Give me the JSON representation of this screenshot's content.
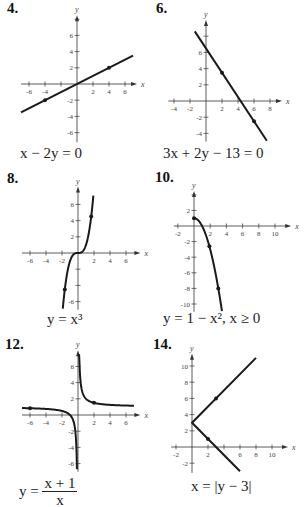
{
  "chart_data": [
    {
      "id": "p4",
      "label": "4.",
      "type": "line",
      "equation": "x − 2y = 0",
      "origin_px": [
        77,
        84
      ],
      "scale_px": [
        8,
        8.1
      ],
      "xlim": [
        -7,
        7
      ],
      "ylim": [
        -7.2,
        8
      ],
      "x_ticks": [
        -6,
        -4,
        -2,
        2,
        4,
        6
      ],
      "x_tick_labels": [
        "-6",
        "-4",
        "",
        "2",
        "4",
        "6"
      ],
      "y_ticks": [
        -6,
        -4,
        -2,
        2,
        4,
        6
      ],
      "y_tick_labels": [
        "-6",
        "-4",
        "-2",
        "2",
        "4",
        "6"
      ],
      "xlabel": "x",
      "ylabel": "y",
      "x_axis_range": [
        -7,
        7.5
      ],
      "y_axis_range": [
        -7.2,
        8.5
      ],
      "series": [
        {
          "name": "x - 2y = 0",
          "kind": "points",
          "x": [
            -7,
            7
          ],
          "y": [
            -3.5,
            3.5
          ]
        }
      ],
      "markers": [
        [
          -4,
          -2
        ],
        [
          4,
          2
        ]
      ],
      "grid": false
    },
    {
      "id": "p6",
      "label": "6.",
      "type": "line",
      "equation": "3x + 2y − 13 = 0",
      "origin_px": [
        206,
        101
      ],
      "scale_px": [
        8,
        8.1
      ],
      "xlim": [
        -4.5,
        9
      ],
      "ylim": [
        -5,
        9.5
      ],
      "x_ticks": [
        -4,
        -2,
        2,
        4,
        6,
        8
      ],
      "x_tick_labels": [
        "-4",
        "-2",
        "2",
        "4",
        "6",
        "8"
      ],
      "y_ticks": [
        -4,
        -2,
        2,
        4,
        6,
        8
      ],
      "y_tick_labels": [
        "-4",
        "-2",
        "2",
        "4",
        "6",
        ""
      ],
      "xlabel": "x",
      "ylabel": "y",
      "x_axis_range": [
        -4.7,
        9.5
      ],
      "y_axis_range": [
        -5,
        10
      ],
      "series": [
        {
          "name": "3x + 2y - 13 = 0",
          "kind": "points",
          "x": [
            -1.4,
            7.6
          ],
          "y": [
            8.6,
            -4.9
          ]
        }
      ],
      "markers": [
        [
          2,
          3.5
        ],
        [
          6,
          -2.5
        ]
      ],
      "grid": false
    },
    {
      "id": "p8",
      "label": "8.",
      "type": "line",
      "equation": "y = x³",
      "origin_px": [
        78,
        253
      ],
      "scale_px": [
        8,
        8.1
      ],
      "xlim": [
        -7,
        7
      ],
      "ylim": [
        -7,
        7.5
      ],
      "x_ticks": [
        -6,
        -4,
        -2,
        2,
        4,
        6
      ],
      "x_tick_labels": [
        "-6",
        "-4",
        "-2",
        "2",
        "4",
        "6"
      ],
      "y_ticks": [
        -6,
        -4,
        -2,
        2,
        4,
        6
      ],
      "y_tick_labels": [
        "-6",
        "",
        "",
        "2",
        "4",
        "6"
      ],
      "xlabel": "x",
      "ylabel": "y",
      "x_axis_range": [
        -7,
        7.8
      ],
      "y_axis_range": [
        -7,
        8.2
      ],
      "series": [
        {
          "name": "y = x^3",
          "kind": "function",
          "fn": "cube",
          "domain": [
            -1.9,
            1.92
          ]
        }
      ],
      "markers": [
        [
          -1.65,
          -4.5
        ],
        [
          1.65,
          4.5
        ]
      ],
      "grid": false
    },
    {
      "id": "p10",
      "label": "10.",
      "type": "line",
      "equation": "y = 1 − x²,  x ≥ 0",
      "origin_px": [
        194,
        226
      ],
      "scale_px": [
        8.1,
        7.8
      ],
      "xlim": [
        -2.5,
        11
      ],
      "ylim": [
        -11,
        3.5
      ],
      "x_ticks": [
        -2,
        2,
        4,
        6,
        8,
        10
      ],
      "x_tick_labels": [
        "-2",
        "2",
        "4",
        "6",
        "8",
        "10"
      ],
      "y_ticks": [
        -10,
        -8,
        -6,
        -4,
        -2,
        2
      ],
      "y_tick_labels": [
        "-10",
        "-8",
        "-6",
        "-4",
        "-2",
        "2"
      ],
      "xlabel": "x",
      "ylabel": "y",
      "x_axis_range": [
        -2.5,
        12
      ],
      "y_axis_range": [
        -11,
        4.5
      ],
      "series": [
        {
          "name": "y = 1 - x^2, x >= 0",
          "kind": "function",
          "fn": "one_minus_sq",
          "domain": [
            0,
            3.45
          ]
        }
      ],
      "markers": [
        [
          0,
          1
        ],
        [
          1.9,
          -2.6
        ],
        [
          3,
          -8
        ]
      ],
      "grid": false
    },
    {
      "id": "p12",
      "label": "12.",
      "type": "line",
      "equation_num": "x + 1",
      "equation_den": "x",
      "equation_lhs": "y =",
      "origin_px": [
        78,
        415
      ],
      "scale_px": [
        8,
        8.1
      ],
      "xlim": [
        -7,
        7
      ],
      "ylim": [
        -7,
        7.5
      ],
      "x_ticks": [
        -6,
        -4,
        -2,
        2,
        4,
        6
      ],
      "x_tick_labels": [
        "-6",
        "-4",
        "-2",
        "2",
        "4",
        "6"
      ],
      "y_ticks": [
        -6,
        -4,
        -2,
        2,
        4,
        6
      ],
      "y_tick_labels": [
        "-6",
        "-4",
        "-2",
        "2",
        "4",
        "6"
      ],
      "xlabel": "x",
      "ylabel": "y",
      "x_axis_range": [
        -7,
        7.8
      ],
      "y_axis_range": [
        -7,
        8
      ],
      "series": [
        {
          "name": "y = (x+1)/x, x<0",
          "kind": "function",
          "fn": "recip_plus_one",
          "domain": [
            -7,
            -0.13
          ]
        },
        {
          "name": "y = (x+1)/x, x>0",
          "kind": "function",
          "fn": "recip_plus_one",
          "domain": [
            0.135,
            7
          ]
        }
      ],
      "markers": [
        [
          -6,
          0.83
        ],
        [
          2,
          1.5
        ]
      ],
      "grid": false
    },
    {
      "id": "p14",
      "label": "14.",
      "type": "line",
      "equation": "x = |y − 3|",
      "origin_px": [
        192,
        447
      ],
      "scale_px": [
        8,
        8.1
      ],
      "xlim": [
        -2.5,
        11
      ],
      "ylim": [
        -3,
        11
      ],
      "x_ticks": [
        -2,
        2,
        4,
        6,
        8,
        10
      ],
      "x_tick_labels": [
        "-2",
        "2",
        "",
        "6",
        "8",
        "10"
      ],
      "y_ticks": [
        -2,
        2,
        4,
        6,
        8,
        10
      ],
      "y_tick_labels": [
        "-2",
        "2",
        "4",
        "6",
        "8",
        "10"
      ],
      "xlabel": "x",
      "ylabel": "y",
      "x_axis_range": [
        -2.6,
        12
      ],
      "y_axis_range": [
        -3.2,
        11.5
      ],
      "series": [
        {
          "name": "x = |y - 3|",
          "kind": "points",
          "x": [
            6,
            0,
            8
          ],
          "y": [
            -3,
            3,
            11
          ]
        }
      ],
      "markers": [
        [
          2,
          1
        ],
        [
          3,
          6
        ]
      ],
      "grid": false
    }
  ],
  "panels": [
    {
      "label": "4.",
      "equation": "x − 2y = 0"
    },
    {
      "label": "6.",
      "equation": "3x + 2y − 13 = 0"
    },
    {
      "label": "8.",
      "equation": "y = x³"
    },
    {
      "label": "10.",
      "equation": "y = 1 − x²,  x ≥ 0"
    },
    {
      "label": "12.",
      "equation_lhs": "y =",
      "equation_num": "x + 1",
      "equation_den": "x"
    },
    {
      "label": "14.",
      "equation": "x = |y − 3|"
    }
  ],
  "style": {
    "curve_color": "#1a1a1a",
    "axis_color": "#333333",
    "tick_label_color": "#444444"
  }
}
